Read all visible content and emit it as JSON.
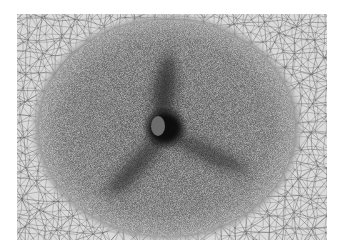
{
  "figure": {
    "colors": {
      "page_background": "#ffffff",
      "outer_mesh_background": "#dadada",
      "mesh_line": "#555555",
      "dense_disc": "#8a8a8a",
      "blade": "#2e2e2e",
      "hub_dark": "#111111",
      "hub_center": "#6f6f6f"
    },
    "hub": {
      "cx": 143,
      "cy": 114
    },
    "blade_count": 3
  }
}
